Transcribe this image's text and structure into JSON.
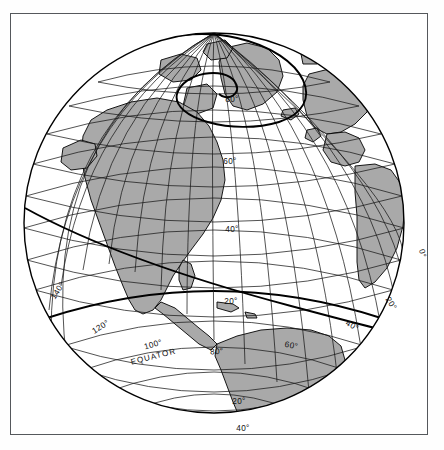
{
  "figure": {
    "kind": "globe-orthographic-illustration",
    "caption": "",
    "frame": {
      "border_color": "#55585c"
    }
  },
  "colors": {
    "land_fill": "#a9a9a9",
    "ocean_fill": "#ffffff",
    "graticule": "#1a1a1a",
    "outline": "#000000",
    "label_text": "#111111"
  },
  "globe": {
    "center_x": 213,
    "center_y": 222,
    "radius": 190,
    "projection": "orthographic",
    "center_lat": 20,
    "center_lon": -70,
    "graticule_step_deg": 10
  },
  "labels": {
    "equator": "EQUATOR",
    "parallels_north": [
      "80°",
      "60°",
      "40°",
      "20°"
    ],
    "parallels_south": [
      "20°",
      "40°"
    ],
    "meridians_left": [
      "140°",
      "120°",
      "100°",
      "80°"
    ],
    "meridians_right": [
      "60°",
      "40°",
      "20°",
      "0°"
    ],
    "items": [
      {
        "id": "lat-80",
        "text": "80°",
        "x": 221,
        "y": 88,
        "rot": 0
      },
      {
        "id": "lat-60",
        "text": "60°",
        "x": 219,
        "y": 150,
        "rot": 0
      },
      {
        "id": "lat-40",
        "text": "40°",
        "x": 221,
        "y": 218,
        "rot": 0
      },
      {
        "id": "lat-20n",
        "text": "20°",
        "x": 220,
        "y": 290,
        "rot": 0
      },
      {
        "id": "lat-20s",
        "text": "20°",
        "x": 228,
        "y": 390,
        "rot": 0
      },
      {
        "id": "lat-40s",
        "text": "40°",
        "x": 232,
        "y": 417,
        "rot": 0
      },
      {
        "id": "lon-140",
        "text": "140°",
        "x": 49,
        "y": 278,
        "rot": -58
      },
      {
        "id": "lon-120",
        "text": "120°",
        "x": 91,
        "y": 315,
        "rot": -32
      },
      {
        "id": "lon-100",
        "text": "100°",
        "x": 143,
        "y": 333,
        "rot": -16
      },
      {
        "id": "equator",
        "text": "EQUATOR",
        "x": 143,
        "y": 345,
        "rot": -14
      },
      {
        "id": "lon-80",
        "text": "80°",
        "x": 206,
        "y": 340,
        "rot": -4
      },
      {
        "id": "lon-60",
        "text": "60°",
        "x": 280,
        "y": 334,
        "rot": 10
      },
      {
        "id": "lon-40",
        "text": "40°",
        "x": 340,
        "y": 314,
        "rot": 30
      },
      {
        "id": "lon-20",
        "text": "20°",
        "x": 378,
        "y": 291,
        "rot": 56
      },
      {
        "id": "lon-0",
        "text": "0°",
        "x": 409,
        "y": 240,
        "rot": 78
      }
    ]
  }
}
